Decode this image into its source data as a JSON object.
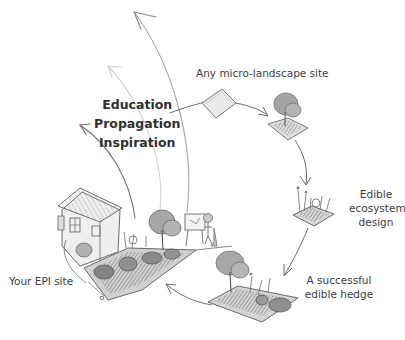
{
  "diagram": {
    "type": "cycle-illustration",
    "style": "hand-drawn pencil sketch, grayscale",
    "outcomes": {
      "items": [
        "Education",
        "Propagation",
        "Inspiration"
      ]
    },
    "stages": [
      {
        "id": "start",
        "label": "Any micro-landscape site"
      },
      {
        "id": "design",
        "label_lines": [
          "Edible",
          "ecosystem",
          "design"
        ]
      },
      {
        "id": "hedge",
        "label_lines": [
          "A successful",
          "edible hedge"
        ]
      },
      {
        "id": "epi",
        "label": "Your EPI site"
      }
    ],
    "colors": {
      "ink": "#555555",
      "light_ink": "#bdbdbd",
      "text": "#3c3c3c",
      "foliage": "#8a8a8a",
      "background": "#ffffff"
    }
  }
}
